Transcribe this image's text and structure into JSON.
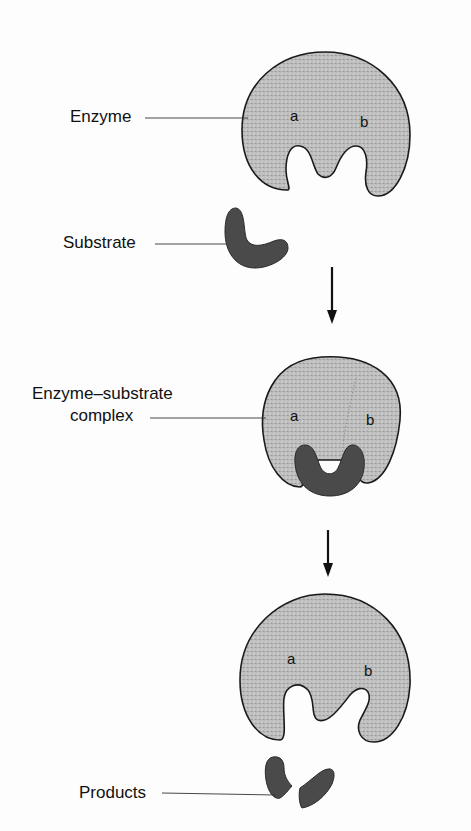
{
  "diagram": {
    "title": "",
    "stages": [
      {
        "id": "enzyme",
        "label": "Enzyme",
        "sites": {
          "a": "a",
          "b": "b"
        }
      },
      {
        "id": "substrate",
        "label": "Substrate"
      },
      {
        "id": "complex",
        "label_line1": "Enzyme–substrate",
        "label_line2": "complex",
        "sites": {
          "a": "a",
          "b": "b"
        }
      },
      {
        "id": "products",
        "label": "Products",
        "sites": {
          "a": "a",
          "b": "b"
        }
      }
    ],
    "arrows": [
      {
        "from": "substrate",
        "to": "complex"
      },
      {
        "from": "complex",
        "to": "products"
      }
    ],
    "colors": {
      "enzyme_fill": "#c4c4c4",
      "enzyme_stipple": "#8a8a8a",
      "substrate_fill": "#4a4a4a",
      "outline": "#1a1a1a",
      "leader_line": "#333333"
    }
  }
}
